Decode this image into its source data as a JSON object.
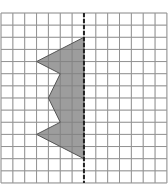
{
  "diagram": {
    "grid": {
      "origin_px": [
        1,
        13
      ],
      "columns": 14,
      "rows": 14,
      "cell_w": 11.85,
      "cell_h": 12.14,
      "line_color": "#b4b4b4"
    },
    "symmetry_line": {
      "column": 7,
      "style": "dashed",
      "color": "#222222"
    },
    "shape": {
      "fill": "#9d9d9d",
      "stroke": "#555555",
      "vertices_grid": [
        [
          7,
          2
        ],
        [
          3,
          4
        ],
        [
          5,
          5
        ],
        [
          4,
          7
        ],
        [
          5,
          9
        ],
        [
          3,
          10
        ],
        [
          7,
          12
        ]
      ]
    }
  }
}
